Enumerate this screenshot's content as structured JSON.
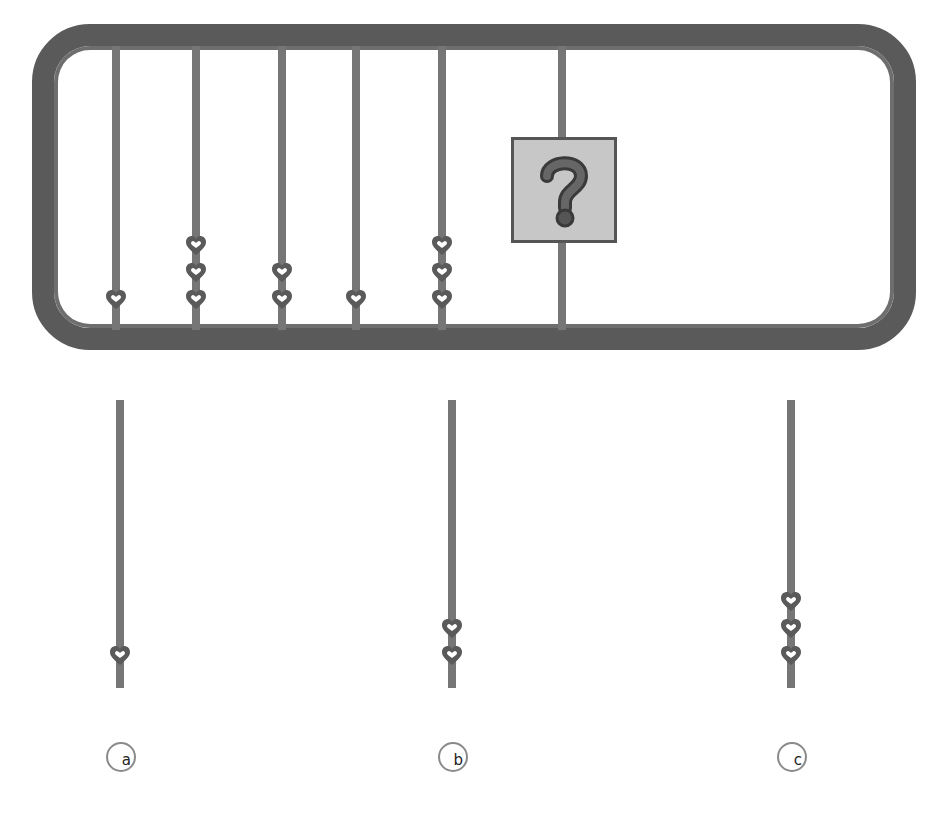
{
  "puzzle": {
    "frame": {
      "border_color": "#5a5a5a",
      "rod_color": "#767676",
      "heart_color": "#5a5a5a"
    },
    "sequence": [
      {
        "rod_x": 116,
        "hearts": 1
      },
      {
        "rod_x": 196,
        "hearts": 3
      },
      {
        "rod_x": 282,
        "hearts": 2
      },
      {
        "rod_x": 356,
        "hearts": 1
      },
      {
        "rod_x": 442,
        "hearts": 3
      },
      {
        "rod_x": 562,
        "hearts": "?"
      }
    ],
    "unknown": {
      "symbol": "?",
      "box_color": "#c7c7c7"
    }
  },
  "options": [
    {
      "label": "a",
      "rod_x": 120,
      "hearts": 1
    },
    {
      "label": "b",
      "rod_x": 452,
      "hearts": 2
    },
    {
      "label": "c",
      "rod_x": 791,
      "hearts": 3
    }
  ]
}
